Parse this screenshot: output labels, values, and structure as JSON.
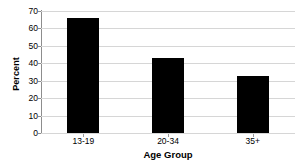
{
  "chart_data": {
    "type": "bar",
    "title": "",
    "subtitle": "",
    "categories": [
      "13-19",
      "20-34",
      "35+"
    ],
    "values": [
      66,
      43,
      32.5
    ],
    "xlabel": "Age Group",
    "ylabel": "Percent",
    "ylim": [
      0,
      70
    ],
    "yticks": [
      0,
      10,
      20,
      30,
      40,
      50,
      60,
      70
    ],
    "ytick_labels": [
      "0",
      "10",
      "20",
      "30",
      "40",
      "50",
      "60",
      "70"
    ],
    "grid": "horizontal",
    "legend": "none",
    "bar_color": "#000000",
    "grid_color": "#d6d6d6",
    "axis_color": "#8d8d8d",
    "background_color": "#ffffff",
    "text_color": "#000000"
  }
}
